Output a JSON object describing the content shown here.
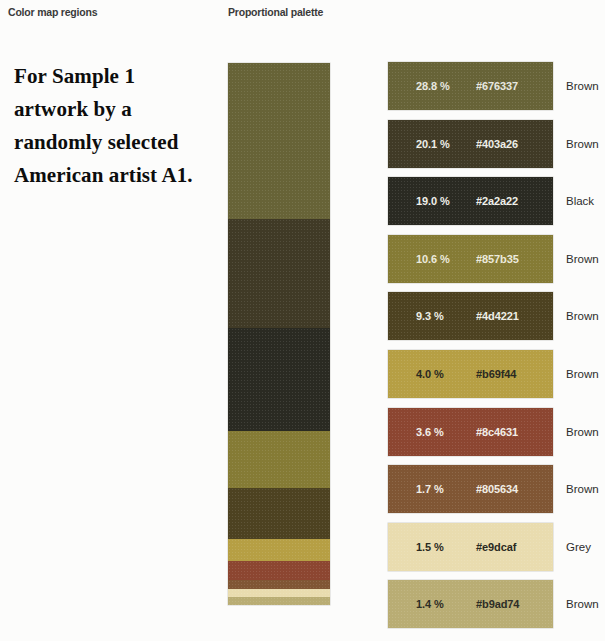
{
  "figure": {
    "background_color": "#fcfcfb",
    "columns": {
      "colormap_header": "Color map regions",
      "palette_header": "Proportional palette"
    },
    "caption": "For Sample 1 artwork by a randomly selected American artist A1."
  },
  "chart_data": {
    "type": "bar",
    "title": "Proportional palette",
    "subtitle": "Color map regions",
    "xlabel": "",
    "ylabel": "Share of artwork area (%)",
    "grid": false,
    "legend_position": "right",
    "orientation": "stacked-vertical",
    "value_unit": "%",
    "total_percent": 100.0,
    "categories": [
      "#676337",
      "#403a26",
      "#2a2a22",
      "#857b35",
      "#4d4221",
      "#b69f44",
      "#8c4631",
      "#805634",
      "#e9dcaf",
      "#b9ad74"
    ],
    "values": [
      28.8,
      20.1,
      19.0,
      10.6,
      9.3,
      4.0,
      3.6,
      1.7,
      1.5,
      1.4
    ],
    "swatches": [
      {
        "percent_label": "28.8 %",
        "percent_value": 28.8,
        "hex_label": "#676337",
        "color": "#676337",
        "family": "Brown",
        "text_color": "#e8e8e0"
      },
      {
        "percent_label": "20.1 %",
        "percent_value": 20.1,
        "hex_label": "#403a26",
        "color": "#403a26",
        "family": "Brown",
        "text_color": "#eeeee8"
      },
      {
        "percent_label": "19.0 %",
        "percent_value": 19.0,
        "hex_label": "#2a2a22",
        "color": "#2a2a22",
        "family": "Black",
        "text_color": "#f0f0ea"
      },
      {
        "percent_label": "10.6 %",
        "percent_value": 10.6,
        "hex_label": "#857b35",
        "color": "#857b35",
        "family": "Brown",
        "text_color": "#eceadc"
      },
      {
        "percent_label": "9.3 %",
        "percent_value": 9.3,
        "hex_label": "#4d4221",
        "color": "#4d4221",
        "family": "Brown",
        "text_color": "#eeeee6"
      },
      {
        "percent_label": "4.0 %",
        "percent_value": 4.0,
        "hex_label": "#b69f44",
        "color": "#b69f44",
        "family": "Brown",
        "text_color": "#2a2a22"
      },
      {
        "percent_label": "3.6 %",
        "percent_value": 3.6,
        "hex_label": "#8c4631",
        "color": "#8c4631",
        "family": "Brown",
        "text_color": "#f2eee8"
      },
      {
        "percent_label": "1.7 %",
        "percent_value": 1.7,
        "hex_label": "#805634",
        "color": "#805634",
        "family": "Brown",
        "text_color": "#f2eee6"
      },
      {
        "percent_label": "1.5 %",
        "percent_value": 1.5,
        "hex_label": "#e9dcaf",
        "color": "#e9dcaf",
        "family": "Grey",
        "text_color": "#2a2a22"
      },
      {
        "percent_label": "1.4 %",
        "percent_value": 1.4,
        "hex_label": "#b9ad74",
        "color": "#b9ad74",
        "family": "Brown",
        "text_color": "#2e2e26"
      }
    ],
    "colormap_bands": [
      {
        "color": "#676337",
        "percent": 28.8
      },
      {
        "color": "#403a26",
        "percent": 20.1
      },
      {
        "color": "#2a2a22",
        "percent": 19.0
      },
      {
        "color": "#857b35",
        "percent": 10.6
      },
      {
        "color": "#4d4221",
        "percent": 9.3
      },
      {
        "color": "#b69f44",
        "percent": 4.0
      },
      {
        "color": "#8c4631",
        "percent": 3.6
      },
      {
        "color": "#805634",
        "percent": 1.7
      },
      {
        "color": "#e9dcaf",
        "percent": 1.5
      },
      {
        "color": "#b9ad74",
        "percent": 1.4
      }
    ]
  }
}
